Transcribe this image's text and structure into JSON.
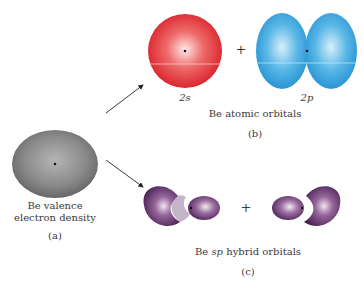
{
  "diagram": {
    "panel_a": {
      "caption_line1": "Be valence",
      "caption_line2": "electron density",
      "tag": "(a)",
      "color": "#8c8c8c"
    },
    "panel_b": {
      "orbital_1": "2s",
      "orbital_2": "2p",
      "plus": "+",
      "caption": "Be atomic orbitals",
      "tag": "(b)",
      "color_2s": "#e8242b",
      "color_2p": "#2a9ad8"
    },
    "panel_c": {
      "plus": "+",
      "caption_prefix": "Be ",
      "caption_italic": "sp",
      "caption_suffix": " hybrid orbitals",
      "tag": "(c)",
      "color": "#6a3a72"
    }
  }
}
